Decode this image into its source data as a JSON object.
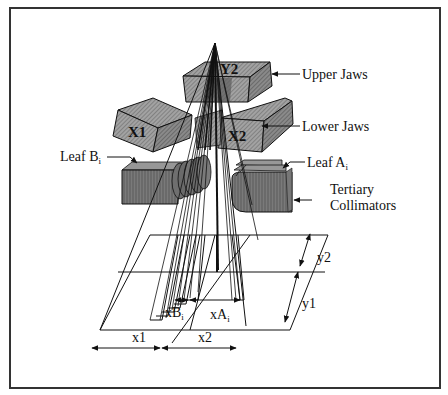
{
  "figure": {
    "type": "collimator-geometry-diagram",
    "colors": {
      "frame": "#333333",
      "line": "#111111",
      "jaw_fill": "#9a9a9a",
      "jaw_side": "#7e7e7e",
      "leaf_fill": "#6f6f6f",
      "leaf_top": "#a8a8a8",
      "beam_shadow": "#555555",
      "background": "#ffffff"
    }
  },
  "jaws": {
    "upper": {
      "block_label": "Y2",
      "callout": "Upper Jaws"
    },
    "lower": {
      "left_block_label": "X1",
      "right_block_label": "X2",
      "callout": "Lower Jaws"
    }
  },
  "leaves": {
    "left": {
      "callout_main": "Leaf B",
      "callout_sub": "i"
    },
    "right": {
      "callout_main": "Leaf A",
      "callout_sub": "i"
    }
  },
  "tertiary": {
    "line1": "Tertiary",
    "line2": "Collimators"
  },
  "dimensions": {
    "xB": {
      "main": "xB",
      "sub": "i"
    },
    "xA": {
      "main": "xA",
      "sub": "i"
    },
    "x1": "x1",
    "x2": "x2",
    "y1": "y1",
    "y2": "y2"
  }
}
